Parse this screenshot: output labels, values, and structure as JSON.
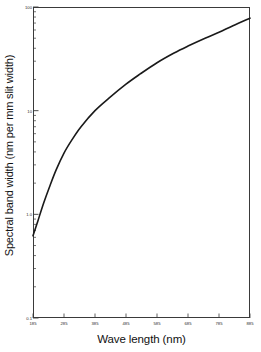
{
  "chart_data": {
    "type": "line",
    "title": "",
    "xlabel": "Wave length (nm)",
    "ylabel": "Spectral band width (nm per mm slit width)",
    "xscale": "linear",
    "yscale": "log",
    "xlim": [
      185,
      885
    ],
    "ylim": [
      0.1,
      100
    ],
    "grid": false,
    "legend": null,
    "xticks": [
      185,
      285,
      385,
      485,
      585,
      685,
      785,
      885
    ],
    "xticklabels": [
      "185",
      "285",
      "385",
      "485",
      "585",
      "685",
      "785",
      "885"
    ],
    "yticks": [
      0.1,
      1.0,
      10,
      100
    ],
    "yticklabels": [
      "0.1",
      "1.0",
      "10",
      "100"
    ],
    "yminorticks": [
      0.2,
      0.3,
      0.4,
      0.5,
      0.6,
      0.7,
      0.8,
      0.9,
      2,
      3,
      4,
      5,
      6,
      7,
      8,
      9,
      20,
      30,
      40,
      50,
      60,
      70,
      80,
      90
    ],
    "series": [
      {
        "name": "Spectral band width",
        "color": "#1a1a1a",
        "linewidth": 1.6,
        "x": [
          185,
          200,
          220,
          240,
          260,
          285,
          310,
          340,
          385,
          430,
          485,
          530,
          585,
          640,
          685,
          740,
          785,
          830,
          885
        ],
        "y": [
          0.62,
          0.85,
          1.3,
          1.9,
          2.7,
          3.9,
          5.2,
          7.0,
          10.0,
          13.2,
          18.0,
          22.5,
          29.0,
          36.0,
          42.0,
          50.0,
          57.0,
          66.0,
          78.0
        ]
      }
    ]
  },
  "axis": {
    "x_title": "Wave length (nm)",
    "y_title": "Spectral band width (nm per mm slit width)"
  }
}
